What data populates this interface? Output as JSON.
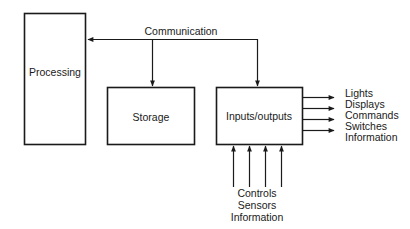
{
  "diagram": {
    "blocks": {
      "processing": "Processing",
      "storage": "Storage",
      "io": "Inputs/outputs"
    },
    "bus_label": "Communication",
    "outputs": [
      "Lights",
      "Displays",
      "Commands",
      "Switches",
      "Information"
    ],
    "inputs": [
      "Controls",
      "Sensors",
      "Information"
    ],
    "colors": {
      "line": "#1a1a1a",
      "background": "#ffffff"
    }
  }
}
